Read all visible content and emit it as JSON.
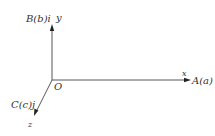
{
  "diagram": {
    "type": "3d-coordinate-axes",
    "origin": {
      "label": "O"
    },
    "axes": {
      "x": {
        "label": "x",
        "point_label": "A(a)"
      },
      "y": {
        "label": "y",
        "point_label": "B(b)i"
      },
      "z": {
        "label": "z",
        "point_label": "C(c)j"
      }
    },
    "colors": {
      "axis": "#444444",
      "text": "#333333"
    }
  }
}
